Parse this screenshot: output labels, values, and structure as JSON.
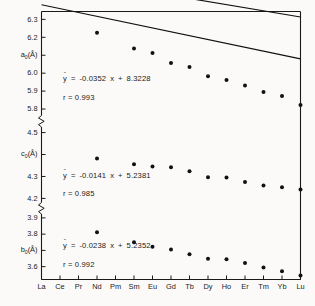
{
  "chart_data": {
    "type": "scatter",
    "title": "",
    "xlabel": "",
    "ylabel": "",
    "grid": false,
    "legend_position": "none",
    "axis_breaks": 2,
    "categories": [
      "La",
      "Ce",
      "Pr",
      "Nd",
      "Pm",
      "Sm",
      "Eu",
      "Gd",
      "Tb",
      "Dy",
      "Ho",
      "Er",
      "Tm",
      "Yb",
      "Lu"
    ],
    "x_index": [
      1,
      2,
      3,
      4,
      5,
      6,
      7,
      8,
      9,
      10,
      11,
      12,
      13,
      14,
      15
    ],
    "panels": [
      {
        "name": "a0",
        "ylabel": "a₀(Å)",
        "ylim": [
          5.75,
          6.33
        ],
        "yticks": [
          6.3,
          6.2,
          6.1,
          6.0,
          5.9,
          5.8
        ],
        "ytick_labels": [
          "6.3",
          "6.2",
          "",
          "6.0",
          "5.9",
          "5.8"
        ],
        "hidden_tick_label_index": 2,
        "equation": "ŷ = -0.0352 x + 8.3228",
        "slope": -0.0352,
        "intercept": 8.3228,
        "r_label": "r = 0.993",
        "r": 0.993,
        "points": [
          {
            "x": 4,
            "category": "Nd",
            "y": 6.225
          },
          {
            "x": 6,
            "category": "Sm",
            "y": 6.137
          },
          {
            "x": 7,
            "category": "Eu",
            "y": 6.113
          },
          {
            "x": 8,
            "category": "Gd",
            "y": 6.057
          },
          {
            "x": 9,
            "category": "Tb",
            "y": 6.035
          },
          {
            "x": 10,
            "category": "Dy",
            "y": 5.983
          },
          {
            "x": 11,
            "category": "Ho",
            "y": 5.962
          },
          {
            "x": 12,
            "category": "Er",
            "y": 5.931
          },
          {
            "x": 13,
            "category": "Tm",
            "y": 5.895
          },
          {
            "x": 14,
            "category": "Yb",
            "y": 5.872
          },
          {
            "x": 15,
            "category": "Lu",
            "y": 5.822
          }
        ]
      },
      {
        "name": "c0",
        "ylabel": "c₀(Å)",
        "ylim": [
          4.17,
          4.53
        ],
        "yticks": [
          4.5,
          4.4,
          4.3,
          4.2
        ],
        "ytick_labels": [
          "4.5",
          "",
          "4.3",
          "4.2"
        ],
        "hidden_tick_label_index": 1,
        "equation": "ŷ = -0.0141 x + 5.2381",
        "slope": -0.0141,
        "intercept": 5.2381,
        "r_label": "r = 0.985",
        "r": 0.985,
        "points": [
          {
            "x": 4,
            "category": "Nd",
            "y": 4.382
          },
          {
            "x": 6,
            "category": "Sm",
            "y": 4.356
          },
          {
            "x": 7,
            "category": "Eu",
            "y": 4.345
          },
          {
            "x": 8,
            "category": "Gd",
            "y": 4.342
          },
          {
            "x": 9,
            "category": "Tb",
            "y": 4.324
          },
          {
            "x": 10,
            "category": "Dy",
            "y": 4.297
          },
          {
            "x": 11,
            "category": "Ho",
            "y": 4.295
          },
          {
            "x": 12,
            "category": "Er",
            "y": 4.275
          },
          {
            "x": 13,
            "category": "Tm",
            "y": 4.259
          },
          {
            "x": 14,
            "category": "Yb",
            "y": 4.251
          },
          {
            "x": 15,
            "category": "Lu",
            "y": 4.241
          }
        ]
      },
      {
        "name": "b0",
        "ylabel": "b₀(Å)",
        "ylim": [
          3.53,
          3.93
        ],
        "yticks": [
          3.9,
          3.8,
          3.7,
          3.6
        ],
        "ytick_labels": [
          "3.9",
          "3.8",
          "",
          "3.6"
        ],
        "hidden_tick_label_index": 2,
        "equation": "ŷ = -0.0238 x + 5.2352",
        "slope": -0.0238,
        "intercept": 5.2352,
        "r_label": "r = 0.992",
        "r": 0.992,
        "points": [
          {
            "x": 4,
            "category": "Nd",
            "y": 3.812
          },
          {
            "x": 6,
            "category": "Sm",
            "y": 3.75
          },
          {
            "x": 7,
            "category": "Eu",
            "y": 3.722
          },
          {
            "x": 8,
            "category": "Gd",
            "y": 3.706
          },
          {
            "x": 9,
            "category": "Tb",
            "y": 3.676
          },
          {
            "x": 10,
            "category": "Dy",
            "y": 3.648
          },
          {
            "x": 11,
            "category": "Ho",
            "y": 3.645
          },
          {
            "x": 12,
            "category": "Er",
            "y": 3.622
          },
          {
            "x": 13,
            "category": "Tm",
            "y": 3.594
          },
          {
            "x": 14,
            "category": "Yb",
            "y": 3.572
          },
          {
            "x": 15,
            "category": "Lu",
            "y": 3.545
          }
        ]
      }
    ]
  },
  "colors": {
    "ink": "#1a1a1a",
    "background": "#fbfaf8",
    "marker": "#111111",
    "line": "#111111"
  }
}
